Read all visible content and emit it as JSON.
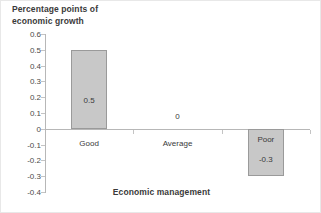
{
  "chart_data": {
    "type": "bar",
    "title": "",
    "categories": [
      "Good",
      "Average",
      "Poor"
    ],
    "values": [
      0.5,
      0,
      -0.3
    ],
    "data_labels": [
      "0.5",
      "0",
      "-0.3"
    ],
    "xlabel": "Economic management",
    "ylabel": "Percentage points of economic growth",
    "ylabel_line1": "Percentage points of",
    "ylabel_line2": "economic growth",
    "ylim": [
      -0.4,
      0.6
    ],
    "ytick_labels": [
      "0.6",
      "0.5",
      "0.4",
      "0.3",
      "0.2",
      "0.1",
      "0",
      "-0.1",
      "-0.2",
      "-0.3",
      "-0.4"
    ],
    "ytick_values": [
      0.6,
      0.5,
      0.4,
      0.3,
      0.2,
      0.1,
      0,
      -0.1,
      -0.2,
      -0.3,
      -0.4
    ],
    "grid": false,
    "legend": "none",
    "series": [
      {
        "name": "Percentage points of economic growth",
        "values": [
          0.5,
          0,
          -0.3
        ]
      }
    ],
    "colors": {
      "bar_fill": "#c8c8c8",
      "bar_border": "#9a9a9a",
      "axis_line": "#b7b7b7",
      "text": "#3a3a3a",
      "background": "#ffffff"
    }
  }
}
